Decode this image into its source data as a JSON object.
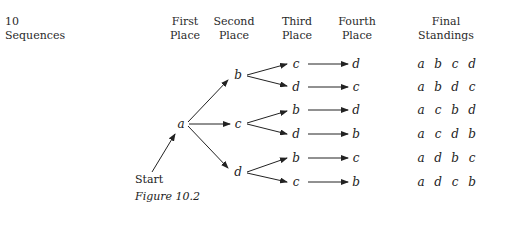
{
  "headers": {
    "sequences_count": "10",
    "sequences_label": "Sequences",
    "first": [
      "First",
      "Place"
    ],
    "second": [
      "Second",
      "Place"
    ],
    "third": [
      "Third",
      "Place"
    ],
    "fourth": [
      "Fourth",
      "Place"
    ],
    "final": [
      "Final",
      "Standings"
    ]
  },
  "tree": {
    "root": "a",
    "second_place": [
      "b",
      "c",
      "d"
    ],
    "third_place": [
      "c",
      "d",
      "b",
      "d",
      "b",
      "c"
    ],
    "fourth_place": [
      "d",
      "c",
      "d",
      "b",
      "c",
      "b"
    ]
  },
  "final_standings": [
    [
      "a",
      "b",
      "c",
      "d"
    ],
    [
      "a",
      "b",
      "d",
      "c"
    ],
    [
      "a",
      "c",
      "b",
      "d"
    ],
    [
      "a",
      "c",
      "d",
      "b"
    ],
    [
      "a",
      "d",
      "b",
      "c"
    ],
    [
      "a",
      "d",
      "c",
      "b"
    ]
  ],
  "start_label": "Start",
  "caption": "Figure 10.2"
}
